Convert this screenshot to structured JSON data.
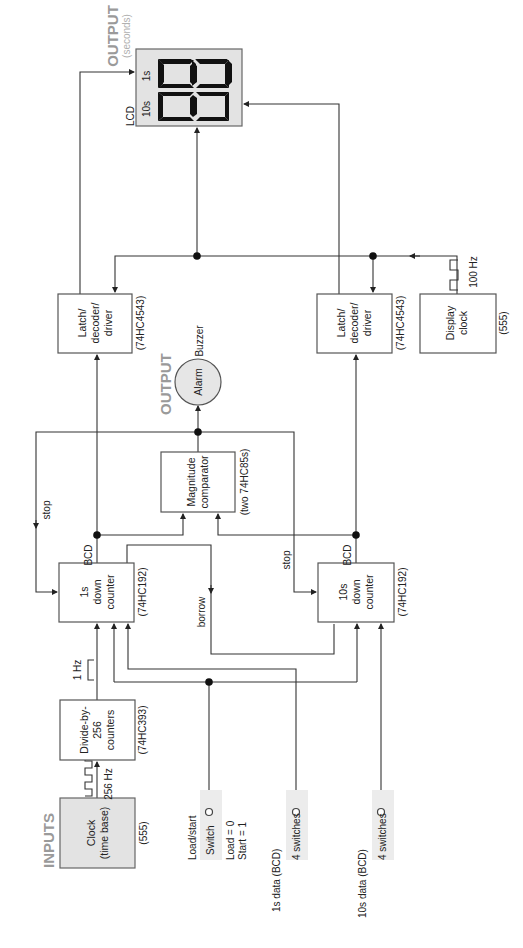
{
  "diagram": {
    "orientation": "rotated-90-ccw",
    "sections": {
      "inputs_header": "INPUTS",
      "output_alarm_header": "OUTPUT",
      "output_lcd_header": "OUTPUT",
      "output_lcd_sub": "(seconds)"
    },
    "blocks": {
      "clock": {
        "line1": "Clock",
        "line2": "(time base)",
        "part": "(555)"
      },
      "divider": {
        "line1": "Divide-by-",
        "line2": "256",
        "line3": "counters",
        "part": "(74HC393)"
      },
      "counter_1s": {
        "line1": "1s",
        "line2": "down",
        "line3": "counter",
        "part": "(74HC192)"
      },
      "counter_10s": {
        "line1": "10s",
        "line2": "down",
        "line3": "counter",
        "part": "(74HC192)"
      },
      "comparator": {
        "line1": "Magnitude",
        "line2": "comparator",
        "part": "(two 74HC85s)"
      },
      "alarm": {
        "label": "Alarm",
        "caption": "Buzzer"
      },
      "latch_1s": {
        "line1": "Latch/",
        "line2": "decoder/",
        "line3": "driver",
        "part": "(74HC4543)"
      },
      "latch_10s": {
        "line1": "Latch/",
        "line2": "decoder/",
        "line3": "driver",
        "part": "(74HC4543)"
      },
      "display_clock": {
        "line1": "Display",
        "line2": "clock",
        "part": "(555)"
      },
      "lcd": {
        "label": "LCD",
        "digit_1s": "1s",
        "digit_10s": "10s"
      }
    },
    "signals": {
      "clock_freq": "256 Hz",
      "divided_freq": "1 Hz",
      "display_freq": "100 Hz",
      "bcd_1s": "BCD",
      "bcd_10s": "BCD",
      "stop_1s": "stop",
      "stop_10s": "stop",
      "borrow": "borrow"
    },
    "inputs": {
      "load_start": {
        "title": "Load/start",
        "control": "Switch",
        "note1": "Load = 0",
        "note2": "Start = 1"
      },
      "data_1s": {
        "title": "1s data (BCD)",
        "control": "4 switches"
      },
      "data_10s": {
        "title": "10s data (BCD)",
        "control": "4 switches"
      }
    }
  }
}
